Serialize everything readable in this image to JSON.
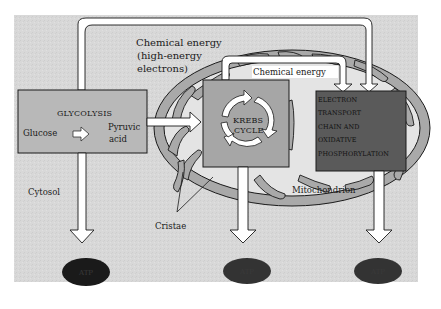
{
  "diagram": {
    "type": "cellular-respiration-overview",
    "colors": {
      "background": "#d6d6d6",
      "box_fill": "#b4b4b4",
      "etc_fill": "#555555",
      "mitochondrion_fill": "#a9a9a9",
      "matrix_fill": "#e6e6e6",
      "arrow_fill": "#ffffff",
      "atp_fill": "#1e1e1e",
      "outline": "#1a1a1a"
    },
    "labels": {
      "chemical_energy_top_line1": "Chemical energy",
      "chemical_energy_top_line2": "(high-energy",
      "chemical_energy_top_line3": "electrons)",
      "chemical_energy_inner": "Chemical energy",
      "cytosol": "Cytosol",
      "cristae": "Cristae",
      "mitochondrion": "Mitochondrion"
    },
    "glycolysis": {
      "title": "GLYCOLYSIS",
      "input": "Glucose",
      "output_line1": "Pyruvic",
      "output_line2": "acid"
    },
    "krebs": {
      "line1": "KREBS",
      "line2": "CYCLE"
    },
    "etc": {
      "lines": [
        "ELECTRON",
        "TRANSPORT",
        "CHAIN AND",
        "OXIDATIVE",
        "PHOSPHORYLATION"
      ]
    },
    "atp": {
      "glycolysis": "ATP",
      "krebs": "ATP",
      "etc": "ATP"
    }
  }
}
